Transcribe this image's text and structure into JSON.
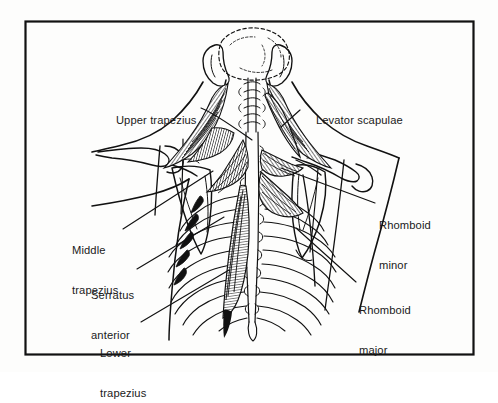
{
  "figure": {
    "background_color": "#fdfdfc",
    "ink_color": "#111111",
    "border": {
      "name": "figure-border",
      "color": "#111111",
      "x": 25,
      "y": 21,
      "width": 449,
      "height": 334
    }
  },
  "labels": [
    {
      "id": "upper-trapezius",
      "lines": [
        "Upper trapezius"
      ],
      "text": "Upper trapezius",
      "x": 103,
      "y": 101,
      "align": "left"
    },
    {
      "id": "levator-scapulae",
      "lines": [
        "Levator scapulae"
      ],
      "text": "Levator scapulae",
      "x": 303,
      "y": 101,
      "align": "left"
    },
    {
      "id": "middle-trapezius",
      "lines": [
        "Middle",
        "trapezius"
      ],
      "line1": "Middle",
      "line2": "trapezius",
      "x": 72,
      "y": 217,
      "align": "left"
    },
    {
      "id": "serratus-anterior",
      "lines": [
        "Serratus",
        "anterior"
      ],
      "line1": "Serratus",
      "line2": "anterior",
      "x": 91,
      "y": 262,
      "align": "left"
    },
    {
      "id": "lower-trapezius",
      "lines": [
        "Lower",
        "trapezius"
      ],
      "line1": "Lower",
      "line2": "trapezius",
      "x": 100,
      "y": 320,
      "align": "left"
    },
    {
      "id": "rhomboid-minor",
      "lines": [
        "Rhomboid",
        "minor"
      ],
      "line1": "Rhomboid",
      "line2": "minor",
      "x": 379,
      "y": 192,
      "align": "left"
    },
    {
      "id": "rhomboid-major",
      "lines": [
        "Rhomboid",
        "major"
      ],
      "line1": "Rhomboid",
      "line2": "major",
      "x": 359,
      "y": 277,
      "align": "left"
    }
  ],
  "leader_lines": [
    {
      "id": "leader-upper-trapezius",
      "from": [
        201,
        108
      ],
      "to": [
        252,
        140
      ]
    },
    {
      "id": "leader-levator-scapulae",
      "from": [
        300,
        110
      ],
      "to": [
        281,
        127
      ]
    },
    {
      "id": "leader-middle-trapezius",
      "from": [
        123,
        229
      ],
      "to": [
        213,
        171
      ]
    },
    {
      "id": "leader-serratus-anterior",
      "from": [
        137,
        269
      ],
      "to": [
        224,
        217
      ]
    },
    {
      "id": "leader-lower-trapezius",
      "from": [
        141,
        322
      ],
      "to": [
        229,
        270
      ]
    },
    {
      "id": "leader-rhomboid-minor",
      "from": [
        375,
        203
      ],
      "to": [
        281,
        168
      ]
    },
    {
      "id": "leader-rhomboid-major",
      "from": [
        356,
        282
      ],
      "to": [
        296,
        228
      ]
    }
  ],
  "anatomy_parts": [
    {
      "id": "skull-base",
      "name": "occiput-and-skull-base"
    },
    {
      "id": "mastoid-left",
      "name": "left-mastoid-process"
    },
    {
      "id": "mastoid-right",
      "name": "right-mastoid-process"
    },
    {
      "id": "cervical-spine",
      "name": "cervical-vertebrae"
    },
    {
      "id": "thoracic-spine",
      "name": "thoracic-vertebrae-spinous-processes"
    },
    {
      "id": "scapula-left",
      "name": "left-scapula"
    },
    {
      "id": "scapula-right",
      "name": "right-scapula"
    },
    {
      "id": "clavicle-left",
      "name": "left-clavicle-acromion"
    },
    {
      "id": "clavicle-right",
      "name": "right-clavicle-acromion"
    },
    {
      "id": "ribcage-left",
      "name": "left-rib-cage"
    },
    {
      "id": "ribcage-right",
      "name": "right-rib-cage"
    },
    {
      "id": "trapezius-upper-fibers",
      "name": "upper-trapezius-muscle-fibers"
    },
    {
      "id": "trapezius-middle-fibers",
      "name": "middle-trapezius-muscle-fibers"
    },
    {
      "id": "trapezius-lower-fibers",
      "name": "lower-trapezius-muscle-fibers"
    },
    {
      "id": "levator-scapulae-muscle",
      "name": "levator-scapulae-muscle"
    },
    {
      "id": "rhomboid-minor-muscle",
      "name": "rhomboid-minor-muscle"
    },
    {
      "id": "rhomboid-major-muscle",
      "name": "rhomboid-major-muscle"
    },
    {
      "id": "serratus-anterior-muscle",
      "name": "serratus-anterior-muscle"
    },
    {
      "id": "arm-left",
      "name": "left-upper-arm-outline"
    },
    {
      "id": "arm-right",
      "name": "right-upper-arm-outline"
    },
    {
      "id": "torso-outline",
      "name": "torso-silhouette"
    }
  ]
}
